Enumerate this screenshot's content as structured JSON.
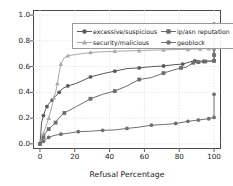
{
  "chart_data": {
    "type": "line",
    "title": "",
    "xlabel": "Refusal Percentage",
    "ylabel": "Cumulative fraction of FQDNs",
    "xlim": [
      -4,
      104
    ],
    "ylim": [
      -0.04,
      1.04
    ],
    "xticks": [
      0,
      20,
      40,
      60,
      80,
      100
    ],
    "yticks": [
      "0.0",
      "0.2",
      "0.4",
      "0.6",
      "0.8",
      "1.0"
    ],
    "grid": true,
    "legend_position": "upper-left",
    "colors": {
      "excessive/suspicious": "#5a5a5a",
      "security/malicious": "#a8a8a8",
      "ip/asn reputation": "#6e6e6e",
      "geoblock": "#707070",
      "frame": "#4a4a4a",
      "grid": "#d8d8d8",
      "text": "#1a1a1a"
    },
    "series": [
      {
        "name": "excessive/suspicious",
        "marker": "circle",
        "color": "#5a5a5a",
        "x": [
          0,
          1,
          2,
          3,
          4,
          5,
          7,
          9,
          11,
          13,
          16,
          21,
          29,
          36,
          43,
          50,
          57,
          64,
          71,
          77,
          82,
          87,
          89,
          94,
          100,
          100,
          100
        ],
        "y": [
          0.0,
          0.17,
          0.22,
          0.26,
          0.29,
          0.31,
          0.34,
          0.37,
          0.4,
          0.43,
          0.45,
          0.47,
          0.52,
          0.545,
          0.565,
          0.585,
          0.59,
          0.6,
          0.605,
          0.615,
          0.62,
          0.64,
          0.645,
          0.64,
          0.645,
          0.74,
          0.93
        ]
      },
      {
        "name": "security/malicious",
        "marker": "triangle",
        "color": "#a8a8a8",
        "x": [
          0,
          1,
          2,
          3,
          5,
          7,
          8,
          9,
          10,
          11,
          12,
          14,
          16,
          21,
          29,
          36,
          43,
          50,
          57,
          64,
          71,
          78,
          85,
          92,
          97,
          100,
          100
        ],
        "y": [
          0.0,
          0.04,
          0.08,
          0.12,
          0.2,
          0.3,
          0.36,
          0.4,
          0.47,
          0.55,
          0.62,
          0.67,
          0.685,
          0.695,
          0.71,
          0.715,
          0.72,
          0.722,
          0.725,
          0.728,
          0.73,
          0.733,
          0.735,
          0.738,
          0.74,
          0.74,
          0.92
        ]
      },
      {
        "name": "ip/asn reputation",
        "marker": "square",
        "color": "#6e6e6e",
        "x": [
          0,
          1,
          2,
          3,
          5,
          7,
          9,
          11,
          14,
          21,
          29,
          36,
          43,
          50,
          57,
          64,
          71,
          77,
          81,
          84,
          88,
          91,
          95,
          100,
          100,
          100
        ],
        "y": [
          0.0,
          0.02,
          0.05,
          0.08,
          0.115,
          0.14,
          0.165,
          0.205,
          0.24,
          0.29,
          0.35,
          0.385,
          0.41,
          0.45,
          0.5,
          0.515,
          0.55,
          0.575,
          0.59,
          0.595,
          0.63,
          0.635,
          0.64,
          0.645,
          0.69,
          0.86
        ]
      },
      {
        "name": "geoblock",
        "marker": "circle",
        "color": "#707070",
        "x": [
          0,
          1,
          2,
          3,
          5,
          8,
          12,
          16,
          22,
          29,
          36,
          43,
          50,
          57,
          64,
          71,
          78,
          85,
          91,
          97,
          100,
          100
        ],
        "y": [
          0.0,
          0.01,
          0.02,
          0.03,
          0.05,
          0.065,
          0.075,
          0.082,
          0.095,
          0.098,
          0.105,
          0.108,
          0.12,
          0.13,
          0.145,
          0.15,
          0.158,
          0.175,
          0.185,
          0.195,
          0.205,
          0.385
        ]
      }
    ]
  },
  "legend": {
    "entries": [
      {
        "label": "excessive/suspicious"
      },
      {
        "label": "ip/asn reputation"
      },
      {
        "label": "security/malicious"
      },
      {
        "label": "geoblock"
      }
    ]
  }
}
